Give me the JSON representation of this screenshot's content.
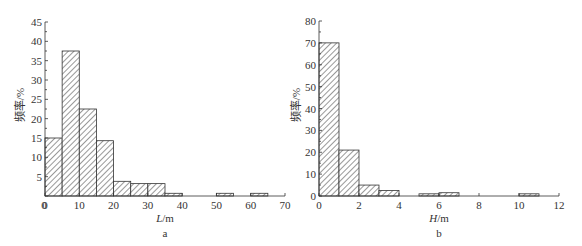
{
  "chart_data": [
    {
      "type": "bar",
      "panel": "a",
      "xlabel": "L/m",
      "ylabel": "频率/%",
      "xlim": [
        0,
        70
      ],
      "ylim": [
        0,
        45
      ],
      "xticks": [
        0,
        10,
        20,
        30,
        40,
        50,
        60,
        70
      ],
      "yticks": [
        5,
        10,
        15,
        20,
        25,
        30,
        35,
        40,
        45
      ],
      "y_zero_label": "0",
      "grid": false,
      "fill": "diagonal-hatch",
      "bins": [
        {
          "x0": 0,
          "x1": 5,
          "value": 15
        },
        {
          "x0": 5,
          "x1": 10,
          "value": 37.5
        },
        {
          "x0": 10,
          "x1": 15,
          "value": 22.5
        },
        {
          "x0": 15,
          "x1": 20,
          "value": 14.3
        },
        {
          "x0": 20,
          "x1": 25,
          "value": 3.8
        },
        {
          "x0": 25,
          "x1": 30,
          "value": 3.2
        },
        {
          "x0": 30,
          "x1": 35,
          "value": 3.2
        },
        {
          "x0": 35,
          "x1": 40,
          "value": 0.7
        },
        {
          "x0": 50,
          "x1": 55,
          "value": 0.7
        },
        {
          "x0": 60,
          "x1": 65,
          "value": 0.7
        }
      ]
    },
    {
      "type": "bar",
      "panel": "b",
      "xlabel": "H/m",
      "ylabel": "频率/%",
      "xlim": [
        0,
        12
      ],
      "ylim": [
        0,
        80
      ],
      "xticks": [
        0,
        2,
        4,
        6,
        8,
        10,
        12
      ],
      "yticks": [
        0,
        10,
        20,
        30,
        40,
        50,
        60,
        70,
        80
      ],
      "grid": false,
      "fill": "diagonal-hatch",
      "bins": [
        {
          "x0": 0,
          "x1": 1,
          "value": 70
        },
        {
          "x0": 1,
          "x1": 2,
          "value": 21
        },
        {
          "x0": 2,
          "x1": 3,
          "value": 5
        },
        {
          "x0": 3,
          "x1": 4,
          "value": 2.5
        },
        {
          "x0": 5,
          "x1": 6,
          "value": 1
        },
        {
          "x0": 6,
          "x1": 7,
          "value": 1.5
        },
        {
          "x0": 10,
          "x1": 11,
          "value": 1
        }
      ]
    }
  ],
  "panels": {
    "a": {
      "label": "a",
      "xlabel_var": "L",
      "xlabel_unit": "/m",
      "ylabel": "频率/%"
    },
    "b": {
      "label": "b",
      "xlabel_var": "H",
      "xlabel_unit": "/m",
      "ylabel": "频率/%"
    }
  }
}
